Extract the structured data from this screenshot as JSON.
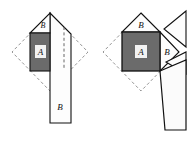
{
  "figure": {
    "title": "",
    "canvas": {
      "width": 191,
      "height": 145,
      "background": "#ffffff"
    },
    "colors": {
      "square_a_fill": "#6b6b6b",
      "piece_fill": "#fdfdfd",
      "stroke": "#111111",
      "dashed_stroke": "#7a7a7a",
      "label_box_fill": "#f2f2f2",
      "background": "#ffffff"
    },
    "panels": [
      {
        "id": "left-panel",
        "name": "left-dissection-figure",
        "labels": {
          "square_a": "A",
          "triangle_b": "B",
          "strip_b": "B"
        }
      },
      {
        "id": "right-panel",
        "name": "right-dissection-figure",
        "labels": {
          "square_a": "A",
          "triangle_b_top": "B",
          "triangle_b_right": "B"
        }
      }
    ]
  }
}
